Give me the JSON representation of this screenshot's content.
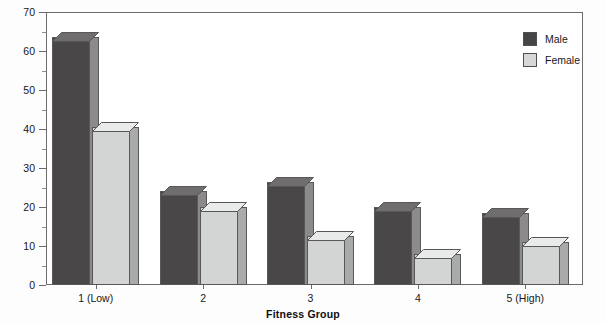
{
  "chart_data": {
    "type": "bar",
    "title": "",
    "xlabel": "Fitness Group",
    "ylabel": "",
    "categories": [
      "1 (Low)",
      "2",
      "3",
      "4",
      "5 (High)"
    ],
    "series": [
      {
        "name": "Male",
        "values": [
          63.5,
          24,
          26.5,
          20,
          18.5
        ]
      },
      {
        "name": "Female",
        "values": [
          40.5,
          20,
          12.5,
          8,
          11
        ]
      }
    ],
    "ylim": [
      0,
      70
    ],
    "y_ticks": [
      0,
      10,
      20,
      30,
      40,
      50,
      60,
      70
    ],
    "y_tick_labels": [
      "0",
      "10",
      "20",
      "30",
      "40",
      "50",
      "60",
      "70"
    ],
    "y_minor_ticks": [
      5,
      15,
      25,
      35,
      45,
      55,
      65
    ],
    "grid": false,
    "legend_position": "top-right",
    "style": "3d-bar",
    "colors": {
      "male_front": "#4a4749",
      "male_side": "#8c8a8b",
      "female_front": "#d3d5d4",
      "female_side": "#a9abaa",
      "axis": "#6b6b6b",
      "text": "#16161a",
      "background": "#ffffff"
    }
  },
  "legend": {
    "items": [
      {
        "label": "Male",
        "swatch": "male"
      },
      {
        "label": "Female",
        "swatch": "female"
      }
    ]
  },
  "axis": {
    "x_title": "Fitness Group"
  }
}
